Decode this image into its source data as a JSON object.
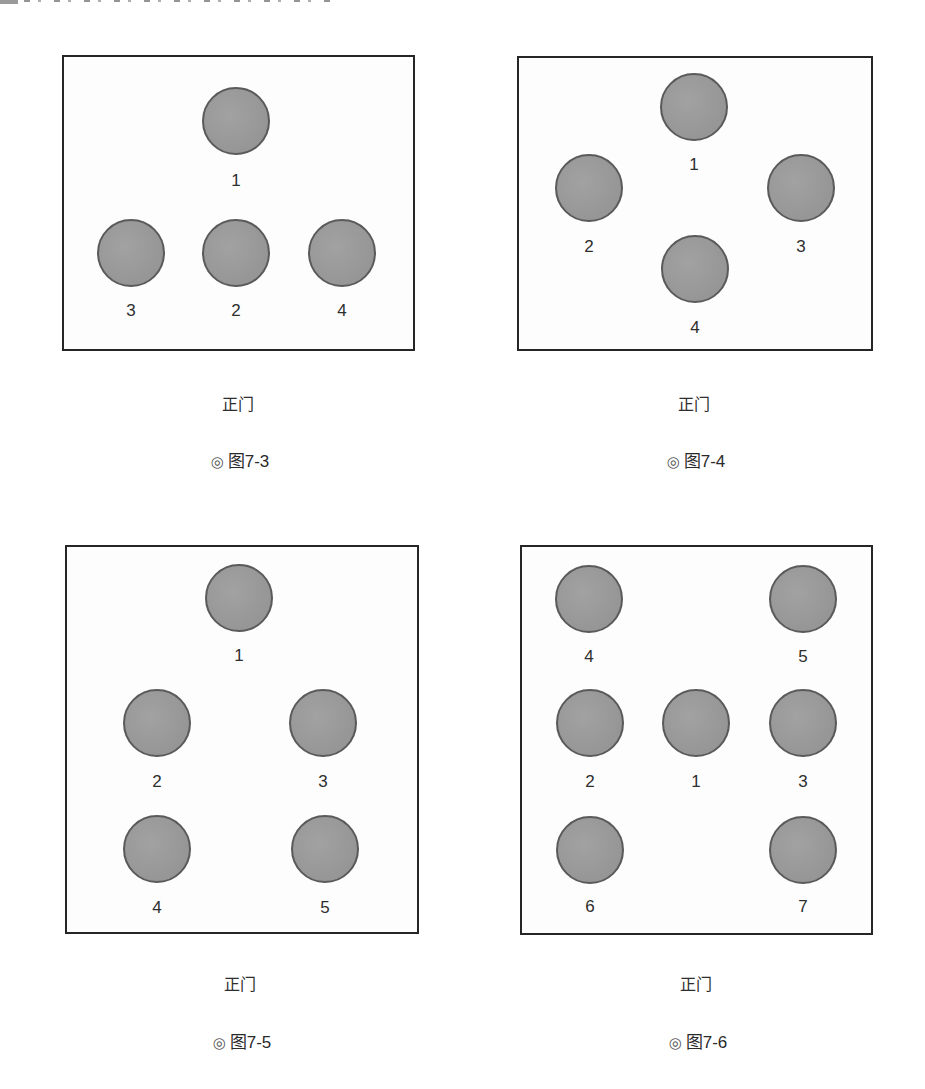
{
  "page": {
    "background": "#ffffff",
    "table_fill": "#9c9c9c",
    "table_border": "#5a5a5a",
    "room_border": "#262626"
  },
  "figures": [
    {
      "id": "fig-7-3",
      "caption_mark": "◎",
      "caption": "图7-3",
      "door_label": "正门",
      "room": {
        "x": 62,
        "y": 55,
        "w": 353,
        "h": 296
      },
      "tables": [
        {
          "label": "1",
          "cx": 236,
          "cy": 121,
          "ly": 181
        },
        {
          "label": "3",
          "cx": 131,
          "cy": 253,
          "ly": 311
        },
        {
          "label": "2",
          "cx": 236,
          "cy": 253,
          "ly": 311
        },
        {
          "label": "4",
          "cx": 342,
          "cy": 253,
          "ly": 311
        }
      ],
      "door_pos": {
        "x": 238,
        "y": 405
      },
      "caption_pos": {
        "x": 240,
        "y": 462
      }
    },
    {
      "id": "fig-7-4",
      "caption_mark": "◎",
      "caption": "图7-4",
      "door_label": "正门",
      "room": {
        "x": 517,
        "y": 56,
        "w": 356,
        "h": 295
      },
      "tables": [
        {
          "label": "1",
          "cx": 694,
          "cy": 107,
          "ly": 165
        },
        {
          "label": "2",
          "cx": 589,
          "cy": 188,
          "ly": 247
        },
        {
          "label": "3",
          "cx": 801,
          "cy": 188,
          "ly": 247
        },
        {
          "label": "4",
          "cx": 695,
          "cy": 269,
          "ly": 328
        }
      ],
      "door_pos": {
        "x": 694,
        "y": 405
      },
      "caption_pos": {
        "x": 696,
        "y": 462
      }
    },
    {
      "id": "fig-7-5",
      "caption_mark": "◎",
      "caption": "图7-5",
      "door_label": "正门",
      "room": {
        "x": 65,
        "y": 545,
        "w": 354,
        "h": 389
      },
      "tables": [
        {
          "label": "1",
          "cx": 239,
          "cy": 598,
          "ly": 656
        },
        {
          "label": "2",
          "cx": 157,
          "cy": 723,
          "ly": 782
        },
        {
          "label": "3",
          "cx": 323,
          "cy": 723,
          "ly": 782
        },
        {
          "label": "4",
          "cx": 157,
          "cy": 849,
          "ly": 908
        },
        {
          "label": "5",
          "cx": 325,
          "cy": 849,
          "ly": 908
        }
      ],
      "door_pos": {
        "x": 240,
        "y": 985
      },
      "caption_pos": {
        "x": 242,
        "y": 1043
      }
    },
    {
      "id": "fig-7-6",
      "caption_mark": "◎",
      "caption": "图7-6",
      "door_label": "正门",
      "room": {
        "x": 520,
        "y": 545,
        "w": 353,
        "h": 390
      },
      "tables": [
        {
          "label": "4",
          "cx": 589,
          "cy": 599,
          "ly": 657
        },
        {
          "label": "5",
          "cx": 803,
          "cy": 599,
          "ly": 657
        },
        {
          "label": "2",
          "cx": 590,
          "cy": 723,
          "ly": 782
        },
        {
          "label": "1",
          "cx": 696,
          "cy": 723,
          "ly": 782
        },
        {
          "label": "3",
          "cx": 803,
          "cy": 723,
          "ly": 782
        },
        {
          "label": "6",
          "cx": 590,
          "cy": 850,
          "ly": 907
        },
        {
          "label": "7",
          "cx": 803,
          "cy": 850,
          "ly": 907
        }
      ],
      "door_pos": {
        "x": 696,
        "y": 985
      },
      "caption_pos": {
        "x": 698,
        "y": 1043
      }
    }
  ]
}
